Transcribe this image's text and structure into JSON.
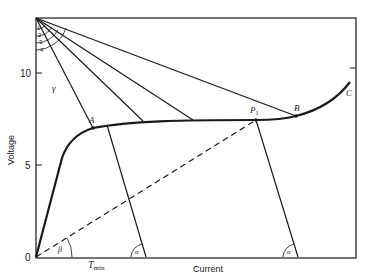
{
  "diagram": {
    "xlabel": "Current",
    "ylabel": "Voltage",
    "y_ticks": [
      {
        "label": "10",
        "y": 73
      },
      {
        "label": "5",
        "y": 165
      },
      {
        "label": "0",
        "y": 257
      }
    ],
    "x_tick_label": "T",
    "x_tick_sub": "min",
    "points": {
      "A": "A",
      "P1": "P",
      "P1_sub": "1",
      "B": "B",
      "C": "C"
    },
    "angles": {
      "gamma": "γ",
      "beta": "β",
      "alpha1": "α",
      "alpha2": "α"
    },
    "arc_labels": [
      "1",
      "2",
      "3",
      "4"
    ],
    "colors": {
      "line": "#1a1a1a",
      "background": "#ffffff"
    }
  }
}
